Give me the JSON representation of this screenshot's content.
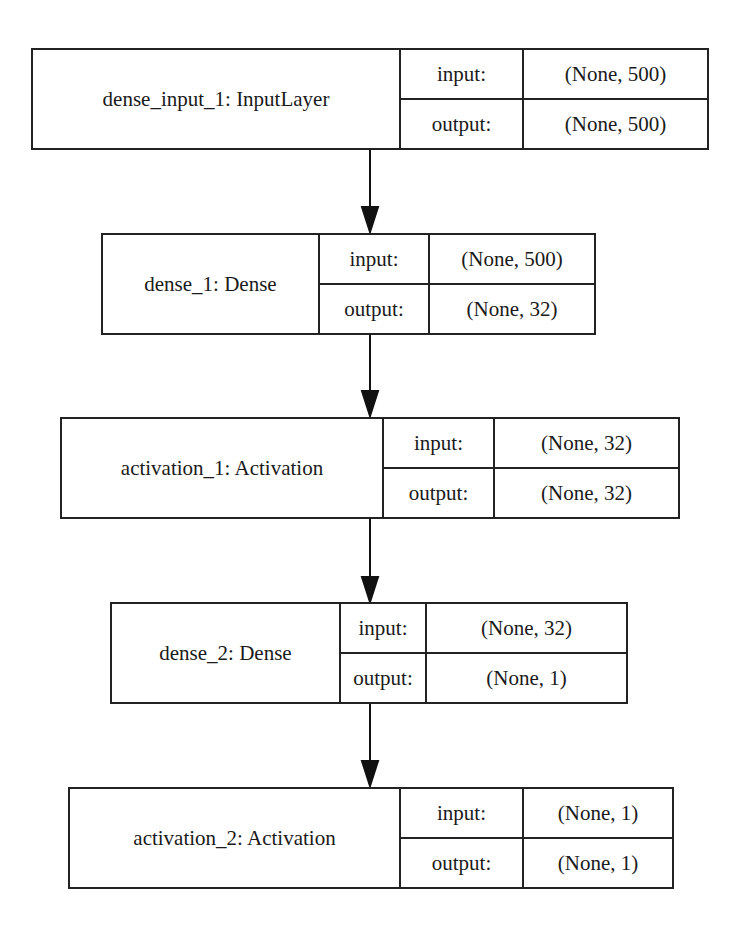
{
  "diagram": {
    "type": "keras-model-plot",
    "layers": [
      {
        "name": "dense_input_1: InputLayer",
        "input_label": "input:",
        "input_shape": "(None, 500)",
        "output_label": "output:",
        "output_shape": "(None, 500)"
      },
      {
        "name": "dense_1: Dense",
        "input_label": "input:",
        "input_shape": "(None, 500)",
        "output_label": "output:",
        "output_shape": "(None, 32)"
      },
      {
        "name": "activation_1: Activation",
        "input_label": "input:",
        "input_shape": "(None, 32)",
        "output_label": "output:",
        "output_shape": "(None, 32)"
      },
      {
        "name": "dense_2: Dense",
        "input_label": "input:",
        "input_shape": "(None, 32)",
        "output_label": "output:",
        "output_shape": "(None, 1)"
      },
      {
        "name": "activation_2: Activation",
        "input_label": "input:",
        "input_shape": "(None, 1)",
        "output_label": "output:",
        "output_shape": "(None, 1)"
      }
    ],
    "edges": [
      {
        "from": "dense_input_1",
        "to": "dense_1"
      },
      {
        "from": "dense_1",
        "to": "activation_1"
      },
      {
        "from": "activation_1",
        "to": "dense_2"
      },
      {
        "from": "dense_2",
        "to": "activation_2"
      }
    ],
    "colors": {
      "stroke": "#222222",
      "background": "#ffffff",
      "text": "#1a1a1a"
    }
  }
}
